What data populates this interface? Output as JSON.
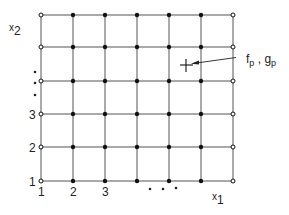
{
  "diagram": {
    "axis_labels": {
      "x1": {
        "base": "x",
        "sub": "1"
      },
      "x2": {
        "base": "x",
        "sub": "2"
      }
    },
    "x_ticks": [
      "1",
      "2",
      "3"
    ],
    "y_ticks": [
      "1",
      "2",
      "3"
    ],
    "ellipsis_x": "• • •",
    "ellipsis_y": "⋮",
    "point_label": {
      "f": "f",
      "f_sub": "p",
      "sep": " , ",
      "g": "g",
      "g_sub": "p"
    },
    "grid": {
      "columns": 7,
      "rows": 6
    },
    "colors": {
      "line": "#555555",
      "node": "#111111",
      "text": "#222222"
    }
  }
}
